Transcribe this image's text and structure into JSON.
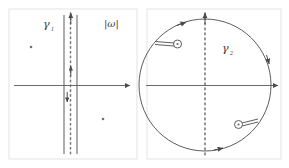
{
  "figure": {
    "background_color": "#ffffff",
    "stroke_color": "#555555",
    "dot_color": "#666666",
    "panel_border_color": "#e2e2e2"
  },
  "panels": [
    {
      "id": "left-panel",
      "name": "gamma-1-strip-contour",
      "contour_label": "γ",
      "contour_label_sub": "1",
      "corner_label": "|ω|",
      "description": "Vertical strip contour about the imaginary axis",
      "axes": {
        "horizontal_axis": {
          "label": "",
          "arrow": "right"
        },
        "vertical_axis": {
          "label": "",
          "arrow": "up",
          "style": "dotted"
        }
      },
      "contour": {
        "type": "vertical-strip",
        "left_line_direction": "down",
        "right_line_direction": "up",
        "arrowheads": [
          {
            "name": "up-arrowhead-top",
            "direction": "up"
          },
          {
            "name": "up-arrowhead-mid",
            "direction": "up"
          },
          {
            "name": "down-arrowhead-mid",
            "direction": "down"
          }
        ]
      },
      "poles": [
        {
          "name": "pole-upper-left",
          "x": 31,
          "y": 47
        },
        {
          "name": "pole-lower-right",
          "x": 103,
          "y": 119
        }
      ]
    },
    {
      "id": "right-panel",
      "name": "gamma-2-circle-contour",
      "contour_label": "γ",
      "contour_label_sub": "2",
      "corner_label": "",
      "description": "Circular contour with two pole indentations",
      "axes": {
        "horizontal_axis": {
          "label": "",
          "arrow": "right"
        },
        "vertical_axis": {
          "label": "",
          "arrow": "up",
          "style": "dotted"
        }
      },
      "contour": {
        "type": "circle",
        "orientation": "clockwise",
        "arrowheads": [
          {
            "name": "arc-arrowhead-top",
            "position": "top"
          },
          {
            "name": "arc-arrowhead-right",
            "position": "right"
          },
          {
            "name": "arc-arrowhead-bottom",
            "position": "bottom"
          }
        ]
      },
      "indentations": [
        {
          "name": "pole-indentation-upper-left",
          "cx": 78,
          "cy": 43
        },
        {
          "name": "pole-indentation-lower-right",
          "cx": 137,
          "cy": 124
        }
      ]
    }
  ]
}
